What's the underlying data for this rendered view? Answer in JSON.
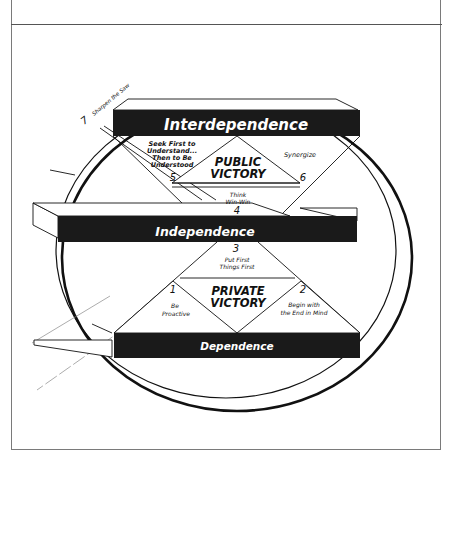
{
  "diagram": {
    "levels": {
      "top": "Interdependence",
      "middle": "Independence",
      "bottom": "Dependence"
    },
    "victories": {
      "public": [
        "PUBLIC",
        "VICTORY"
      ],
      "private": [
        "PRIVATE",
        "VICTORY"
      ]
    },
    "habits": [
      {
        "number": "1",
        "lines": [
          "Be",
          "Proactive"
        ]
      },
      {
        "number": "2",
        "lines": [
          "Begin with",
          "the End in Mind"
        ]
      },
      {
        "number": "3",
        "lines": [
          "Put First",
          "Things First"
        ]
      },
      {
        "number": "4",
        "lines": [
          "Think",
          "Win-Win"
        ]
      },
      {
        "number": "5",
        "lines": [
          "Seek First to",
          "Understand...",
          "Then to Be",
          "Understood"
        ]
      },
      {
        "number": "6",
        "lines": [
          "Synergize"
        ]
      },
      {
        "number": "7",
        "lines": [
          "Sharpen the Saw"
        ]
      }
    ],
    "colors": {
      "bar": "#1a1a1a",
      "line": "#111111",
      "frame": "#7a7a7a",
      "background": "#ffffff"
    }
  }
}
